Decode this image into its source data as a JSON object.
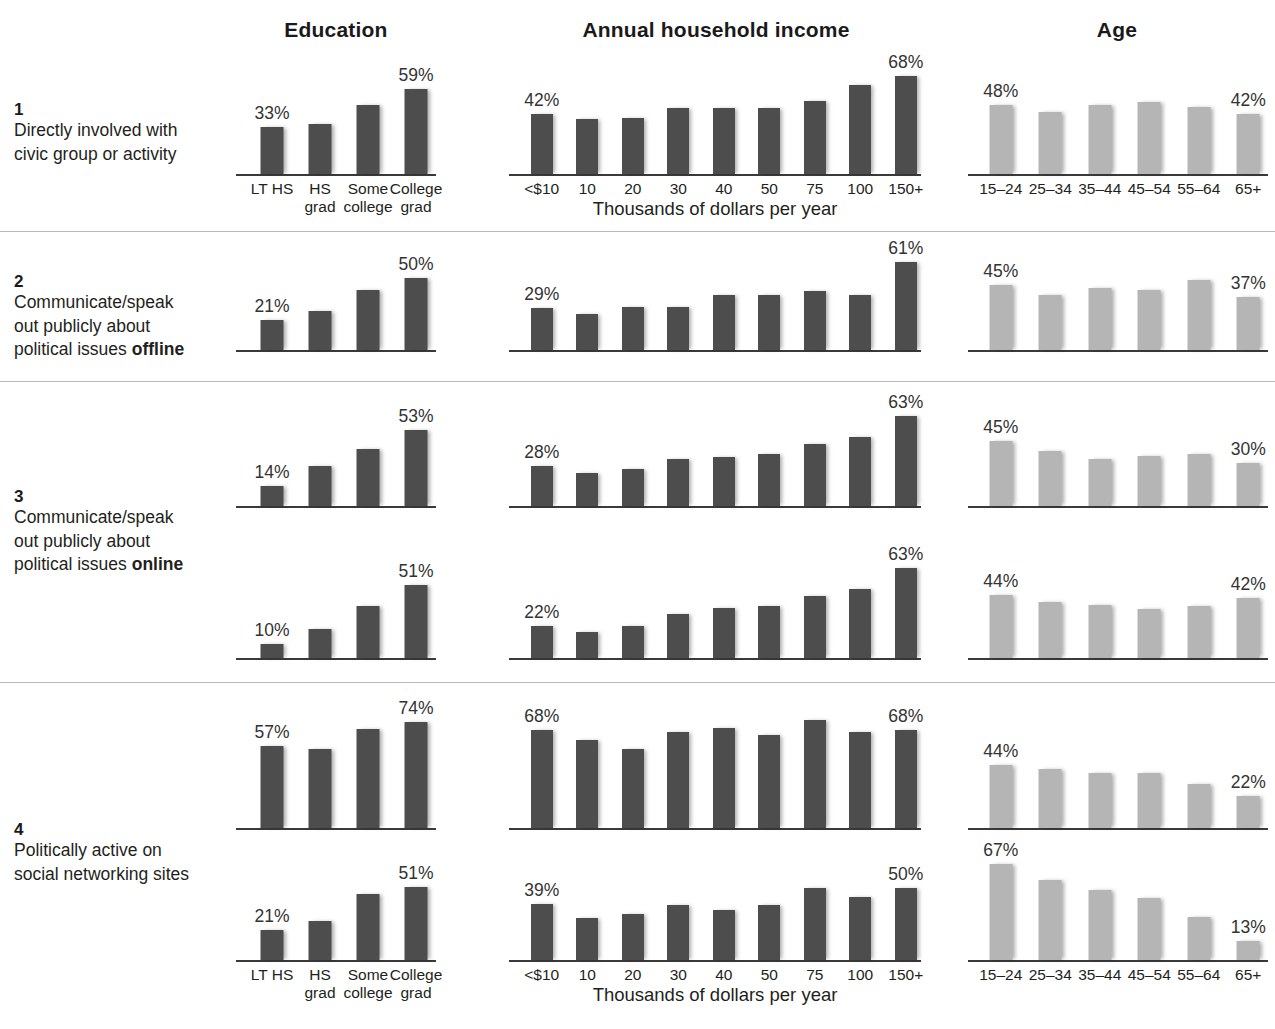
{
  "headers": {
    "education": "Education",
    "income": "Annual household income",
    "age": "Age"
  },
  "axis_caption": "Thousands of dollars per year",
  "categories": {
    "education": [
      "LT HS",
      "HS\ngrad",
      "Some\ncollege",
      "College\ngrad"
    ],
    "income": [
      "<$10",
      "10",
      "20",
      "30",
      "40",
      "50",
      "75",
      "100",
      "150+"
    ],
    "age": [
      "15–24",
      "25–34",
      "35–44",
      "45–54",
      "55–64",
      "65+"
    ]
  },
  "rows": [
    {
      "number": "1",
      "text": "Directly involved with civic group or activity",
      "text_html": "Directly involved with<br>civic group or activity"
    },
    {
      "number": "2",
      "text": "Communicate/speak out publicly about political issues offline",
      "text_html": "Communicate/speak<br>out publicly about<br>political issues <b>offline</b>"
    },
    {
      "number": "3",
      "text": "Communicate/speak out publicly about political issues online",
      "text_html": "Communicate/speak<br>out publicly about<br>political issues <b>online</b>"
    },
    {
      "number": "4",
      "text": "Politically active on social networking sites",
      "text_html": "Politically active on<br>social networking sites"
    }
  ],
  "chart_data": {
    "type": "bar",
    "ylabel": "Percent",
    "ylim": [
      0,
      80
    ],
    "grid": false,
    "legend": "none",
    "value_label_rule": "only first and last bar of each panel are labeled",
    "colors": {
      "education_bars": "#4d4d4d",
      "income_bars": "#4d4d4d",
      "age_bars": "#b5b5b5",
      "axis": "#3a3a3a",
      "text": "#231f20"
    },
    "panels": [
      {
        "row": "1",
        "row_label": "Directly involved with civic group or activity",
        "education": {
          "categories": [
            "LT HS",
            "HS grad",
            "Some college",
            "College grad"
          ],
          "values": [
            33,
            35,
            48,
            59
          ],
          "labeled": [
            "33%",
            null,
            null,
            "59%"
          ]
        },
        "income": {
          "categories": [
            "<$10",
            "10",
            "20",
            "30",
            "40",
            "50",
            "75",
            "100",
            "150+"
          ],
          "values": [
            42,
            38,
            39,
            46,
            46,
            46,
            51,
            62,
            68
          ],
          "labeled": [
            "42%",
            null,
            null,
            null,
            null,
            null,
            null,
            null,
            "68%"
          ]
        },
        "age": {
          "categories": [
            "15–24",
            "25–34",
            "35–44",
            "45–54",
            "55–64",
            "65+"
          ],
          "values": [
            48,
            43,
            48,
            50,
            47,
            42
          ],
          "labeled": [
            "48%",
            null,
            null,
            null,
            null,
            "42%"
          ]
        }
      },
      {
        "row": "2",
        "row_label": "Communicate/speak out publicly about political issues offline",
        "education": {
          "categories": [
            "LT HS",
            "HS grad",
            "Some college",
            "College grad"
          ],
          "values": [
            21,
            27,
            42,
            50
          ],
          "labeled": [
            "21%",
            null,
            null,
            "50%"
          ]
        },
        "income": {
          "categories": [
            "<$10",
            "10",
            "20",
            "30",
            "40",
            "50",
            "75",
            "100",
            "150+"
          ],
          "values": [
            29,
            25,
            30,
            30,
            38,
            38,
            41,
            38,
            61
          ],
          "labeled": [
            "29%",
            null,
            null,
            null,
            null,
            null,
            null,
            null,
            "61%"
          ]
        },
        "age": {
          "categories": [
            "15–24",
            "25–34",
            "35–44",
            "45–54",
            "55–64",
            "65+"
          ],
          "values": [
            45,
            38,
            43,
            42,
            49,
            37
          ],
          "labeled": [
            "45%",
            null,
            null,
            null,
            null,
            "37%"
          ]
        }
      },
      {
        "row": "3a",
        "row_label": "Communicate/speak out publicly about political issues offline (3)",
        "education": {
          "categories": [
            "LT HS",
            "HS grad",
            "Some college",
            "College grad"
          ],
          "values": [
            14,
            28,
            40,
            53
          ],
          "labeled": [
            "14%",
            null,
            null,
            "53%"
          ]
        },
        "income": {
          "categories": [
            "<$10",
            "10",
            "20",
            "30",
            "40",
            "50",
            "75",
            "100",
            "150+"
          ],
          "values": [
            28,
            23,
            26,
            33,
            34,
            36,
            43,
            48,
            63
          ],
          "labeled": [
            "28%",
            null,
            null,
            null,
            null,
            null,
            null,
            null,
            "63%"
          ]
        },
        "age": {
          "categories": [
            "15–24",
            "25–34",
            "35–44",
            "45–54",
            "55–64",
            "65+"
          ],
          "values": [
            45,
            38,
            33,
            35,
            36,
            30
          ],
          "labeled": [
            "45%",
            null,
            null,
            null,
            null,
            "30%"
          ]
        }
      },
      {
        "row": "3b",
        "row_label": "Communicate/speak out publicly about political issues online",
        "education": {
          "categories": [
            "LT HS",
            "HS grad",
            "Some college",
            "College grad"
          ],
          "values": [
            10,
            20,
            36,
            51
          ],
          "labeled": [
            "10%",
            null,
            null,
            "51%"
          ]
        },
        "income": {
          "categories": [
            "<$10",
            "10",
            "20",
            "30",
            "40",
            "50",
            "75",
            "100",
            "150+"
          ],
          "values": [
            22,
            18,
            22,
            31,
            35,
            36,
            43,
            48,
            63
          ],
          "labeled": [
            "22%",
            null,
            null,
            null,
            null,
            null,
            null,
            null,
            "63%"
          ]
        },
        "age": {
          "categories": [
            "15–24",
            "25–34",
            "35–44",
            "45–54",
            "55–64",
            "65+"
          ],
          "values": [
            44,
            39,
            37,
            34,
            36,
            42
          ],
          "labeled": [
            "44%",
            null,
            null,
            null,
            null,
            "42%"
          ]
        }
      },
      {
        "row": "4a",
        "row_label": "Politically active on social networking sites (higher panel)",
        "education": {
          "categories": [
            "LT HS",
            "HS grad",
            "Some college",
            "College grad"
          ],
          "values": [
            57,
            55,
            69,
            74
          ],
          "labeled": [
            "57%",
            null,
            null,
            "74%"
          ]
        },
        "income": {
          "categories": [
            "<$10",
            "10",
            "20",
            "30",
            "40",
            "50",
            "75",
            "100",
            "150+"
          ],
          "values": [
            68,
            61,
            55,
            67,
            70,
            65,
            75,
            67,
            68
          ],
          "labeled": [
            "68%",
            null,
            null,
            null,
            null,
            null,
            null,
            null,
            "68%"
          ]
        },
        "age": {
          "categories": [
            "15–24",
            "25–34",
            "35–44",
            "45–54",
            "55–64",
            "65+"
          ],
          "values": [
            44,
            41,
            38,
            38,
            31,
            22
          ],
          "labeled": [
            "44%",
            null,
            null,
            null,
            null,
            "22%"
          ]
        }
      },
      {
        "row": "4b",
        "row_label": "Politically active on social networking sites (lower panel)",
        "education": {
          "categories": [
            "LT HS",
            "HS grad",
            "Some college",
            "College grad"
          ],
          "values": [
            21,
            27,
            46,
            51
          ],
          "labeled": [
            "21%",
            null,
            null,
            "51%"
          ]
        },
        "income": {
          "categories": [
            "<$10",
            "10",
            "20",
            "30",
            "40",
            "50",
            "75",
            "100",
            "150+"
          ],
          "values": [
            39,
            29,
            32,
            38,
            35,
            38,
            50,
            44,
            50
          ],
          "labeled": [
            "39%",
            null,
            null,
            null,
            null,
            null,
            null,
            null,
            "50%"
          ]
        },
        "age": {
          "categories": [
            "15–24",
            "25–34",
            "35–44",
            "45–54",
            "55–64",
            "65+"
          ],
          "values": [
            67,
            56,
            49,
            43,
            30,
            13
          ],
          "labeled": [
            "67%",
            null,
            null,
            null,
            null,
            "13%"
          ]
        }
      }
    ]
  }
}
